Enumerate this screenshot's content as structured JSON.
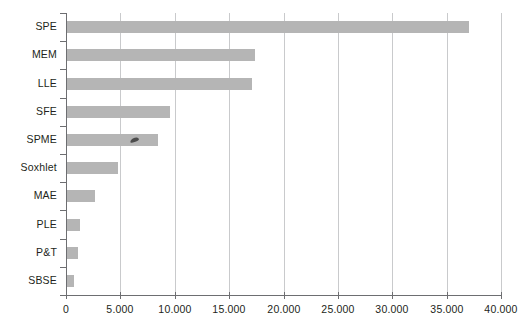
{
  "chart_data": {
    "type": "bar",
    "orientation": "horizontal",
    "title": "",
    "subtitle": "",
    "xlabel": "",
    "ylabel": "",
    "categories": [
      "SPE",
      "MEM",
      "LLE",
      "SFE",
      "SPME",
      "Soxhlet",
      "MAE",
      "PLE",
      "P&T",
      "SBSE"
    ],
    "values": [
      37000,
      17300,
      17000,
      9500,
      8350,
      4700,
      2600,
      1200,
      1000,
      600
    ],
    "xlim": [
      0,
      40000
    ],
    "ylim": null,
    "xticks": [
      0,
      5000,
      10000,
      15000,
      20000,
      25000,
      30000,
      35000,
      40000
    ],
    "xtick_labels": [
      "0",
      "5.000",
      "10.000",
      "15.000",
      "20.000",
      "25.000",
      "30.000",
      "35.000",
      "40.000"
    ],
    "grid": "vertical",
    "legend": null,
    "legend_position": "none",
    "bar_color": "#b5b5b5",
    "axis_color": "#6d6e71",
    "gridline_color": "#c9cacc",
    "background_color": "#ffffff",
    "annotations": [
      {
        "name": "scan-speck",
        "category": "SPME",
        "note": ""
      }
    ]
  }
}
